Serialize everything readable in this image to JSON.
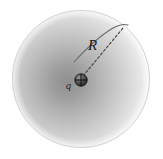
{
  "figure": {
    "background_color": "#ffffff",
    "sphere": {
      "name": "charged-sphere",
      "center_x": 81,
      "center_y": 79,
      "radius": 69,
      "fill_light": "#f2f2f2",
      "fill_mid": "#d8d8d8",
      "fill_dark": "#9a9a9a",
      "edge_color": "#cfcfcf"
    },
    "point_charge": {
      "name": "point-charge",
      "symbol": "plus-in-circle",
      "center_x": 81,
      "center_y": 80,
      "radius": 6,
      "color": "#2b2b2b",
      "label": "q",
      "label_x": 68,
      "label_y": 88
    },
    "radius_line": {
      "name": "radius-dashed-line",
      "style": "dashed",
      "x1": 82,
      "y1": 78,
      "x2": 123,
      "y2": 28,
      "color": "#3a3a3a",
      "label": "R",
      "label_x": 88,
      "label_y": 49
    },
    "arc": {
      "name": "surface-arc",
      "style": "solid",
      "color": "#555555",
      "start_x": 74,
      "start_y": 62,
      "end_x": 127,
      "end_y": 25
    }
  }
}
